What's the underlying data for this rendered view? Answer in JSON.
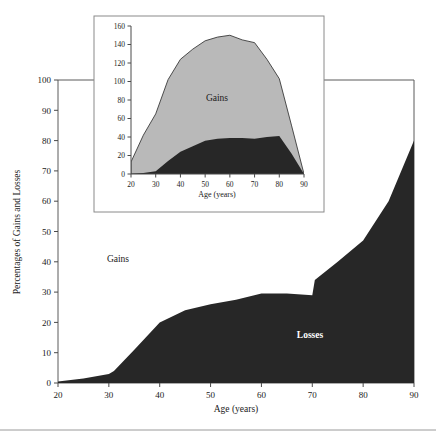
{
  "chart_data": [
    {
      "id": "main",
      "type": "area",
      "title": "",
      "xlabel": "Age (years)",
      "ylabel": "Percentages of Gains and Losses",
      "xlim": [
        20,
        90
      ],
      "ylim": [
        0,
        100
      ],
      "xticks": [
        20,
        30,
        40,
        50,
        60,
        70,
        80,
        90
      ],
      "yticks": [
        0,
        10,
        20,
        30,
        40,
        50,
        60,
        70,
        80,
        90,
        100
      ],
      "grid": false,
      "legend_position": "inline-annotations",
      "stacked": true,
      "x": [
        20,
        25,
        30,
        31,
        35,
        40,
        45,
        50,
        55,
        60,
        65,
        70,
        70.5,
        75,
        80,
        85,
        90
      ],
      "series": [
        {
          "name": "Losses",
          "label": "Losses",
          "color": "#272727",
          "values": [
            0.5,
            1.5,
            3.0,
            4.0,
            11.0,
            20.0,
            24.0,
            26.0,
            27.5,
            29.5,
            29.5,
            29.0,
            34.0,
            40.0,
            47.0,
            60.0,
            80.0
          ]
        },
        {
          "name": "Gains",
          "label": "Gains",
          "color": "#ffffff",
          "values": [
            99.5,
            98.5,
            97.0,
            96.0,
            89.0,
            80.0,
            76.0,
            74.0,
            72.5,
            70.5,
            70.5,
            71.0,
            66.0,
            60.0,
            53.0,
            40.0,
            20.0
          ]
        }
      ],
      "annotations": [
        {
          "text": "Gains",
          "x": 32,
          "y": 43,
          "style": "dark"
        },
        {
          "text": "Losses",
          "x": 68,
          "y": 15,
          "style": "light"
        }
      ]
    },
    {
      "id": "inset",
      "type": "area",
      "title": "",
      "xlabel": "Age (years)",
      "ylabel": "",
      "xlim": [
        20,
        90
      ],
      "ylim": [
        0,
        160
      ],
      "xticks": [
        20,
        30,
        40,
        50,
        60,
        70,
        80,
        90
      ],
      "yticks": [
        0,
        20,
        40,
        60,
        80,
        100,
        120,
        140,
        160
      ],
      "grid": false,
      "legend_position": "inline-annotations",
      "stacked": true,
      "x": [
        20,
        25,
        30,
        35,
        40,
        45,
        50,
        55,
        60,
        65,
        70,
        75,
        80,
        85,
        90
      ],
      "series": [
        {
          "name": "Losses",
          "label": "Losses",
          "color": "#272727",
          "values": [
            0,
            1,
            3,
            14,
            24,
            30,
            36,
            38,
            39,
            39,
            38,
            40,
            41,
            22,
            0
          ]
        },
        {
          "name": "Gains",
          "label": "Gains",
          "color": "#b9b9b9",
          "values": [
            13,
            41,
            62,
            88,
            100,
            105,
            108,
            110,
            111,
            106,
            104,
            84,
            62,
            30,
            0
          ]
        }
      ],
      "totals": [
        13,
        42,
        65,
        102,
        124,
        135,
        144,
        148,
        150,
        145,
        142,
        124,
        103,
        52,
        0
      ],
      "annotations": [
        {
          "text": "Gains",
          "x": 55,
          "y": 82,
          "style": "dark"
        }
      ]
    }
  ],
  "main_chart": {
    "ylabel": "Percentages of Gains and Losses",
    "xlabel": "Age (years)",
    "xticks": [
      "20",
      "30",
      "40",
      "50",
      "60",
      "70",
      "80",
      "90"
    ],
    "yticks": [
      "0",
      "10",
      "20",
      "30",
      "40",
      "50",
      "60",
      "70",
      "80",
      "90",
      "100"
    ],
    "gains_label": "Gains",
    "losses_label": "Losses"
  },
  "inset_chart": {
    "xlabel": "Age (years)",
    "xticks": [
      "20",
      "30",
      "40",
      "50",
      "60",
      "70",
      "80",
      "90"
    ],
    "yticks": [
      "0",
      "20",
      "40",
      "60",
      "80",
      "100",
      "120",
      "140",
      "160"
    ],
    "gains_label": "Gains"
  },
  "colors": {
    "losses_fill": "#272727",
    "gains_fill_main": "#ffffff",
    "gains_fill_inset": "#b9b9b9",
    "frame_stroke": "#5a5a5a",
    "text": "#1a1a1a"
  }
}
